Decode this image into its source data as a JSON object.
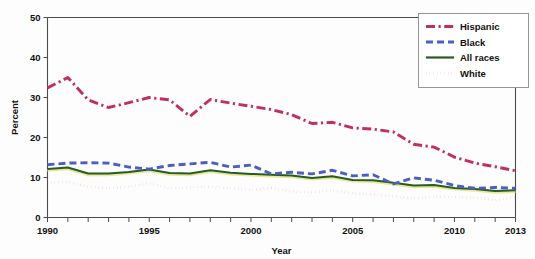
{
  "chart_data": {
    "type": "line",
    "title": "",
    "xlabel": "Year",
    "ylabel": "Percent",
    "xlim": [
      1990,
      2013
    ],
    "ylim": [
      0,
      50
    ],
    "grid": false,
    "legend_position": "top-right",
    "x": [
      1990,
      1991,
      1992,
      1993,
      1994,
      1995,
      1996,
      1997,
      1998,
      1999,
      2000,
      2001,
      2002,
      2003,
      2004,
      2005,
      2006,
      2007,
      2008,
      2009,
      2010,
      2011,
      2012,
      2013
    ],
    "xticks": [
      1990,
      1995,
      2000,
      2005,
      2010,
      2013
    ],
    "xtick_labels": [
      "1990",
      "1995",
      "2000",
      "2005",
      "2010",
      "2013"
    ],
    "yticks": [
      0,
      10,
      20,
      30,
      40,
      50
    ],
    "ytick_labels": [
      "0",
      "10",
      "20",
      "30",
      "40",
      "50"
    ],
    "series": [
      {
        "name": "Hispanic",
        "color": "#c0305c",
        "style": "dashdot",
        "values": [
          32.4,
          35.0,
          29.4,
          27.5,
          28.7,
          30.0,
          29.4,
          25.3,
          29.5,
          28.6,
          27.8,
          27.0,
          25.7,
          23.5,
          23.8,
          22.4,
          22.1,
          21.4,
          18.3,
          17.6,
          15.1,
          13.6,
          12.7,
          11.7
        ]
      },
      {
        "name": "Black",
        "color": "#4a5fc1",
        "style": "dashed",
        "values": [
          13.2,
          13.6,
          13.7,
          13.6,
          12.6,
          12.1,
          13.0,
          13.4,
          13.8,
          12.6,
          13.1,
          10.9,
          11.3,
          10.9,
          11.8,
          10.4,
          10.7,
          8.4,
          9.9,
          9.3,
          8.0,
          7.3,
          7.5,
          7.3
        ]
      },
      {
        "name": "All races",
        "color": "#265b26",
        "style": "solid",
        "values": [
          12.1,
          12.5,
          11.0,
          11.0,
          11.4,
          12.0,
          11.1,
          11.0,
          11.8,
          11.2,
          10.9,
          10.7,
          10.5,
          9.9,
          10.3,
          9.4,
          9.3,
          8.7,
          8.0,
          8.1,
          7.4,
          7.1,
          6.6,
          6.8
        ]
      },
      {
        "name": "White",
        "color": "#e02020",
        "style": "dotted",
        "values": [
          8.7,
          8.9,
          7.7,
          7.3,
          7.7,
          8.6,
          7.3,
          7.6,
          7.7,
          7.3,
          6.9,
          7.3,
          6.5,
          6.3,
          6.8,
          6.0,
          5.8,
          5.3,
          4.8,
          5.2,
          5.1,
          5.0,
          4.3,
          5.1
        ]
      }
    ]
  },
  "axes": {
    "y_title": "Percent",
    "x_title": "Year"
  },
  "legend": {
    "items": [
      {
        "label": "Hispanic"
      },
      {
        "label": "Black"
      },
      {
        "label": "All races"
      },
      {
        "label": "White"
      }
    ]
  }
}
